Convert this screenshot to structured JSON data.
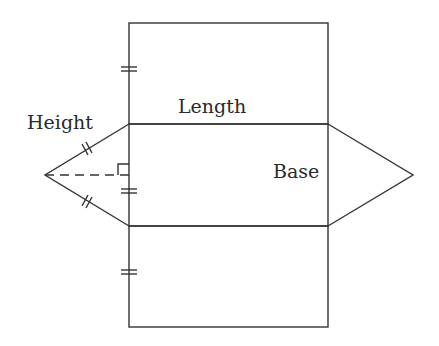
{
  "diagram": {
    "labels": {
      "height": "Height",
      "length": "Length",
      "base": "Base"
    },
    "stroke_color": "#333333",
    "text_color": "#2a2a2a"
  }
}
